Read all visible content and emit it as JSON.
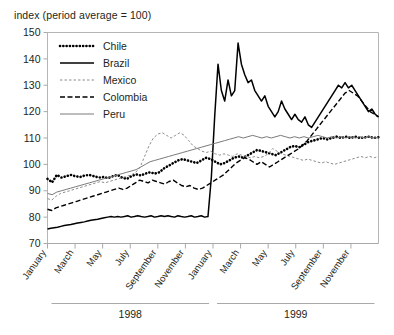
{
  "chart_data": {
    "type": "line",
    "title": "index (period average = 100)",
    "ylabel": "",
    "xlabel": "",
    "ylim": [
      70,
      150
    ],
    "ytick_step": 10,
    "yticks": [
      70,
      80,
      90,
      100,
      110,
      120,
      130,
      140,
      150
    ],
    "grid": false,
    "legend_position": "top-left",
    "x_groups": [
      {
        "label": "1998",
        "ticks": [
          "January",
          "March",
          "May",
          "July",
          "September",
          "November"
        ]
      },
      {
        "label": "1999",
        "ticks": [
          "January",
          "March",
          "May",
          "July",
          "September",
          "November"
        ]
      }
    ],
    "x_unit": "month",
    "x_range": [
      "1998-01",
      "1999-12"
    ],
    "series": [
      {
        "name": "Chile",
        "style": "dotted-thick",
        "color": "#000000",
        "values": [
          94.5,
          93.2,
          96.0,
          95.0,
          95.5,
          96.0,
          95.5,
          95.2,
          95.8,
          96.0,
          95.5,
          95.0,
          95.2,
          94.8,
          95.5,
          96.0,
          95.0,
          94.5,
          95.5,
          96.2,
          95.8,
          96.5,
          97.0,
          96.5,
          97.0,
          98.5,
          99.5,
          100.5,
          101.5,
          102.0,
          101.5,
          101.0,
          100.5,
          101.5,
          102.5,
          102.0,
          101.0,
          100.0,
          100.5,
          101.5,
          102.5,
          103.0,
          102.5,
          103.5,
          104.5,
          105.5,
          105.0,
          104.5,
          104.0,
          103.5,
          104.5,
          105.5,
          106.5,
          107.0,
          106.5,
          107.5,
          108.5,
          109.0,
          109.5,
          110.0,
          109.5,
          110.0,
          110.5,
          110.0,
          110.5,
          110.0,
          110.5,
          110.0,
          110.2,
          110.5,
          110.0,
          110.3
        ]
      },
      {
        "name": "Brazil",
        "style": "solid-thick",
        "color": "#000000",
        "values": [
          75.5,
          75.8,
          76.0,
          76.2,
          76.5,
          76.8,
          77.0,
          77.2,
          77.5,
          77.8,
          78.0,
          78.2,
          78.5,
          78.8,
          79.0,
          79.2,
          79.5,
          79.8,
          80.0,
          80.2,
          80.0,
          80.2,
          80.0,
          80.2,
          80.5,
          80.0,
          80.2,
          80.5,
          80.2,
          80.0,
          80.2,
          80.5,
          80.0,
          80.2,
          80.5,
          80.2,
          80.5,
          80.2,
          80.0,
          80.5,
          80.2,
          80.0,
          80.2,
          80.5,
          80.0,
          80.2,
          80.5,
          80.0,
          80.2,
          95.0,
          118.0,
          138.0,
          128.0,
          124.0,
          132.0,
          126.0,
          128.0,
          146.0,
          138.0,
          134.0,
          131.0,
          132.0,
          128.0,
          126.0,
          124.0,
          126.0,
          122.0,
          120.0,
          118.0,
          120.0,
          124.0,
          121.0,
          119.0,
          117.0,
          119.0,
          117.0,
          116.0,
          118.0,
          115.0,
          114.0,
          116.0,
          118.0,
          120.0,
          122.0,
          124.0,
          126.0,
          128.0,
          130.0,
          129.0,
          131.0,
          129.0,
          130.0,
          128.0,
          126.0,
          124.0,
          122.0,
          120.0,
          121.0,
          119.0,
          118.0
        ]
      },
      {
        "name": "Mexico",
        "style": "dotted-thin",
        "color": "#8c8c8c",
        "values": [
          87.0,
          86.5,
          88.0,
          89.0,
          89.5,
          90.0,
          90.5,
          91.0,
          91.5,
          92.0,
          92.5,
          93.0,
          93.5,
          93.0,
          93.5,
          94.0,
          94.5,
          95.0,
          95.5,
          96.0,
          97.0,
          99.0,
          103.0,
          107.0,
          110.0,
          111.5,
          112.0,
          111.0,
          110.0,
          111.0,
          112.0,
          111.0,
          109.0,
          107.0,
          106.0,
          105.0,
          104.5,
          105.0,
          104.0,
          103.5,
          104.0,
          103.5,
          103.0,
          104.0,
          103.5,
          103.0,
          102.5,
          103.0,
          102.5,
          103.0,
          104.0,
          106.0,
          105.0,
          104.0,
          103.5,
          103.0,
          102.5,
          102.0,
          101.5,
          102.0,
          101.5,
          101.0,
          100.5,
          101.0,
          100.5,
          100.0,
          100.5,
          101.0,
          101.5,
          102.0,
          102.5,
          103.0,
          102.5,
          103.0,
          102.5,
          103.0
        ]
      },
      {
        "name": "Colombia",
        "style": "dashed",
        "color": "#000000",
        "values": [
          83.0,
          82.5,
          83.5,
          84.0,
          84.5,
          85.0,
          85.5,
          86.0,
          86.5,
          87.0,
          87.5,
          88.0,
          88.5,
          89.0,
          89.5,
          90.0,
          90.5,
          91.0,
          90.5,
          91.0,
          92.0,
          93.0,
          94.0,
          93.5,
          93.0,
          94.0,
          93.5,
          93.0,
          92.5,
          93.5,
          94.0,
          93.0,
          92.0,
          91.5,
          92.0,
          91.0,
          90.5,
          91.0,
          92.0,
          93.0,
          94.0,
          95.0,
          96.0,
          97.5,
          99.0,
          100.5,
          101.5,
          102.5,
          102.0,
          101.0,
          100.0,
          101.0,
          100.0,
          99.0,
          100.0,
          101.0,
          102.0,
          103.0,
          104.0,
          105.0,
          106.0,
          107.5,
          109.0,
          111.0,
          113.0,
          115.0,
          117.0,
          119.0,
          121.0,
          123.0,
          125.0,
          127.0,
          128.0,
          127.0,
          126.0,
          124.0,
          122.0,
          120.0,
          119.0,
          118.0
        ]
      },
      {
        "name": "Peru",
        "style": "solid-thin",
        "color": "#7a7a7a",
        "values": [
          89.0,
          88.5,
          89.5,
          90.0,
          90.5,
          91.0,
          91.5,
          92.0,
          92.5,
          93.0,
          93.5,
          94.0,
          94.5,
          95.0,
          95.5,
          96.0,
          96.5,
          97.0,
          97.5,
          98.0,
          99.0,
          100.0,
          101.0,
          101.5,
          102.0,
          102.5,
          103.0,
          103.5,
          104.0,
          104.5,
          105.0,
          105.5,
          106.0,
          106.5,
          107.0,
          107.5,
          108.0,
          108.5,
          109.0,
          109.5,
          110.0,
          110.5,
          110.0,
          110.5,
          111.0,
          110.5,
          110.0,
          110.5,
          110.0,
          110.5,
          111.0,
          110.5,
          110.0,
          110.5,
          110.0,
          110.5,
          110.0,
          110.5,
          111.0,
          110.5,
          110.0,
          110.5,
          110.0,
          110.5,
          110.0,
          110.5,
          110.0,
          110.5,
          110.0,
          110.5,
          110.0,
          110.2
        ]
      }
    ]
  }
}
